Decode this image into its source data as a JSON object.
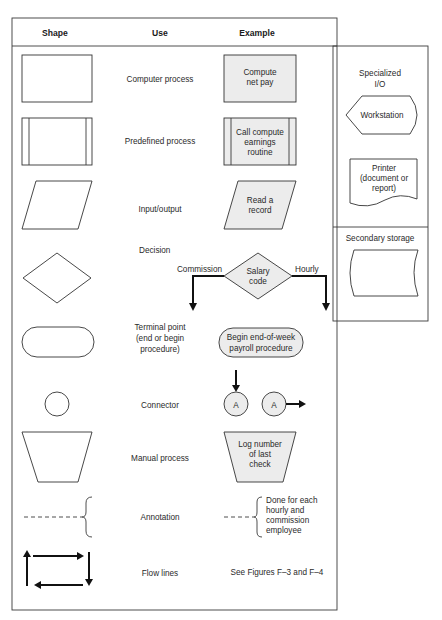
{
  "header": {
    "shape": "Shape",
    "use": "Use",
    "example": "Example"
  },
  "rows": [
    {
      "shape": "rectangle",
      "use": [
        "Computer process"
      ],
      "example": [
        "Compute",
        "net pay"
      ]
    },
    {
      "shape": "rectangle-with-side-bars",
      "use": [
        "Predefined process"
      ],
      "example": [
        "Call compute",
        "earnings",
        "routine"
      ]
    },
    {
      "shape": "parallelogram",
      "use": [
        "Input/output"
      ],
      "example": [
        "Read a",
        "record"
      ]
    },
    {
      "shape": "diamond",
      "use": [
        "Decision"
      ],
      "example": [
        "Salary",
        "code"
      ],
      "branches": {
        "left": "Commission",
        "right": "Hourly"
      }
    },
    {
      "shape": "rounded-terminal",
      "use": [
        "Terminal point",
        "(end or begin",
        "procedure)"
      ],
      "example": [
        "Begin end-of-week",
        "payroll procedure"
      ]
    },
    {
      "shape": "circle",
      "use": [
        "Connector"
      ],
      "example": [
        "A",
        "A"
      ]
    },
    {
      "shape": "trapezoid",
      "use": [
        "Manual process"
      ],
      "example": [
        "Log number",
        "of last",
        "check"
      ]
    },
    {
      "shape": "dashed-brace",
      "use": [
        "Annotation"
      ],
      "example": [
        "Done for each",
        "hourly and",
        "commission",
        "employee"
      ]
    },
    {
      "shape": "flow-arrows",
      "use": [
        "Flow lines"
      ],
      "example": [
        "See Figures F–3 and F–4"
      ]
    }
  ],
  "side_panel": {
    "specialized_io": {
      "title": [
        "Specialized",
        "I/O"
      ],
      "workstation": "Workstation",
      "printer": [
        "Printer",
        "(document or",
        "report)"
      ]
    },
    "secondary_storage": {
      "title": "Secondary storage"
    }
  },
  "colors": {
    "example_fill": "#ececec",
    "line": "#333333",
    "arrow": "#111111"
  }
}
